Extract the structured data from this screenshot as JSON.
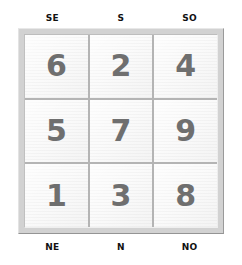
{
  "figure": {
    "background_color": "#ffffff",
    "frame_color": "#d2d2d2",
    "divider_color": "#b4b4b4",
    "cell_color": "#fafafa",
    "digit_color": "#6f6f6f",
    "label_color": "#111111"
  },
  "labels": {
    "top": [
      {
        "text": "SE",
        "column": 0
      },
      {
        "text": "S",
        "column": 1
      },
      {
        "text": "SO",
        "column": 2
      }
    ],
    "bottom": [
      {
        "text": "NE",
        "column": 0
      },
      {
        "text": "N",
        "column": 1
      },
      {
        "text": "NO",
        "column": 2
      }
    ]
  },
  "grid": {
    "rows": 3,
    "columns": 3,
    "cells": [
      {
        "value": "6",
        "row": 0,
        "col": 0
      },
      {
        "value": "2",
        "row": 0,
        "col": 1
      },
      {
        "value": "4",
        "row": 0,
        "col": 2
      },
      {
        "value": "5",
        "row": 1,
        "col": 0
      },
      {
        "value": "7",
        "row": 1,
        "col": 1
      },
      {
        "value": "9",
        "row": 1,
        "col": 2
      },
      {
        "value": "1",
        "row": 2,
        "col": 0
      },
      {
        "value": "3",
        "row": 2,
        "col": 1
      },
      {
        "value": "8",
        "row": 2,
        "col": 2
      }
    ]
  }
}
